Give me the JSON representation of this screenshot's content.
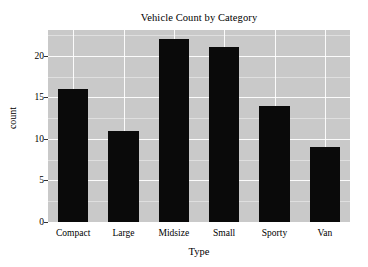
{
  "chart_data": {
    "type": "bar",
    "title": "Vehicle Count by Category",
    "xlabel": "Type",
    "ylabel": "count",
    "categories": [
      "Compact",
      "Large",
      "Midsize",
      "Small",
      "Sporty",
      "Van"
    ],
    "values": [
      16,
      11,
      22,
      21,
      14,
      9
    ],
    "yticks": [
      0,
      5,
      10,
      15,
      20
    ],
    "ytick_labels": [
      "0",
      "5",
      "10",
      "15",
      "20"
    ],
    "ylim": [
      0,
      23.1
    ],
    "grid": true,
    "legend": "none",
    "bar_color": "#0a0a0a",
    "panel_color": "#c9c9c9",
    "grid_color": "#ffffff",
    "background_color": "#ffffff",
    "text_color": "#000000"
  }
}
